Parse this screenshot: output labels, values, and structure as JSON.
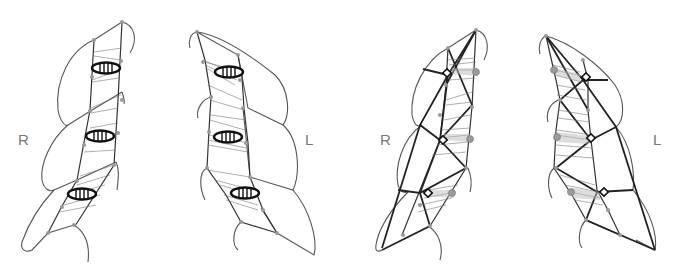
{
  "panels": [
    {
      "id": "panel-1",
      "side_label": "R",
      "style": "hatched-ellipses"
    },
    {
      "id": "panel-2",
      "side_label": "L",
      "style": "hatched-ellipses"
    },
    {
      "id": "panel-3",
      "side_label": "R",
      "style": "lattice-with-markers"
    },
    {
      "id": "panel-4",
      "side_label": "L",
      "style": "lattice-with-markers"
    }
  ],
  "colors": {
    "outline": "#555555",
    "bold_line": "#222222",
    "node": "#999999",
    "ellipse": "#111111"
  }
}
